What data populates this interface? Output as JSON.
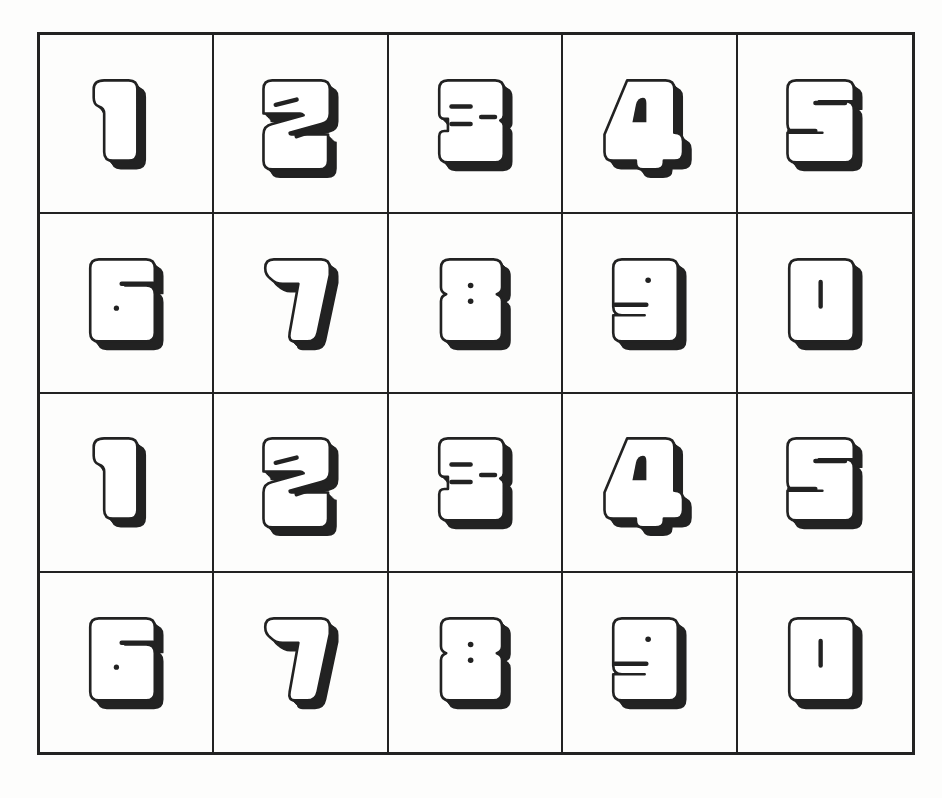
{
  "page": {
    "colors": {
      "line": "#222222",
      "shadow": "#222222",
      "fill": "#ffffff",
      "paper": "#fdfdfc"
    }
  },
  "grid": {
    "rows": 4,
    "cols": 5,
    "cells": [
      {
        "digit": "1"
      },
      {
        "digit": "2"
      },
      {
        "digit": "3"
      },
      {
        "digit": "4"
      },
      {
        "digit": "5"
      },
      {
        "digit": "6"
      },
      {
        "digit": "7"
      },
      {
        "digit": "8"
      },
      {
        "digit": "9"
      },
      {
        "digit": "0"
      },
      {
        "digit": "1"
      },
      {
        "digit": "2"
      },
      {
        "digit": "3"
      },
      {
        "digit": "4"
      },
      {
        "digit": "5"
      },
      {
        "digit": "6"
      },
      {
        "digit": "7"
      },
      {
        "digit": "8"
      },
      {
        "digit": "9"
      },
      {
        "digit": "0"
      }
    ]
  }
}
